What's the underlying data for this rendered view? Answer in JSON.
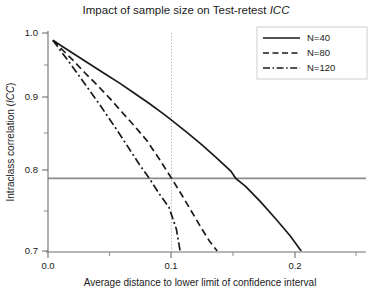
{
  "chart_data": {
    "type": "line",
    "title": "Impact of sample size on Test-retest ICC",
    "title_plain": "Impact of sample size on Test-retest ",
    "title_italic": "ICC",
    "xlabel": "Average distance to lower limit of confidence interval",
    "ylabel_plain": "Intraclass correlation (",
    "ylabel_italic": "ICC",
    "ylabel_tail": ")",
    "ylabel": "Intraclass correlation (ICC)",
    "xlim": [
      0.0,
      0.227
    ],
    "ylim": [
      0.7,
      1.0
    ],
    "xticks": [
      0.0,
      0.1,
      0.2
    ],
    "xticklabels": [
      "0.0",
      "0.1",
      "0.2"
    ],
    "xminorticks": [
      0.05,
      0.15,
      0.2225
    ],
    "yticks": [
      0.7,
      0.8,
      0.9,
      1.0
    ],
    "yticklabels": [
      "0.7",
      "0.8",
      "0.9",
      "1.0"
    ],
    "yminorticks": [
      0.75,
      0.85,
      0.95
    ],
    "grid": false,
    "legend_position": "top-right",
    "reference_lines": [
      {
        "name": "icc-threshold",
        "orient": "horizontal",
        "value": 0.8,
        "style": "solid"
      },
      {
        "name": "distance-threshold",
        "orient": "vertical",
        "value": 0.1,
        "style": "dotted"
      }
    ],
    "series": [
      {
        "name": "N=40",
        "style": "solid",
        "icc_at_0.1": 0.849,
        "distance_at_icc_0.8": 0.152,
        "points": [
          [
            0.004,
            0.99
          ],
          [
            0.012,
            0.981
          ],
          [
            0.022,
            0.97
          ],
          [
            0.034,
            0.957
          ],
          [
            0.046,
            0.944
          ],
          [
            0.058,
            0.931
          ],
          [
            0.07,
            0.917
          ],
          [
            0.082,
            0.903
          ],
          [
            0.094,
            0.888
          ],
          [
            0.1,
            0.88
          ],
          [
            0.112,
            0.864
          ],
          [
            0.124,
            0.847
          ],
          [
            0.136,
            0.829
          ],
          [
            0.148,
            0.81
          ],
          [
            0.152,
            0.8
          ],
          [
            0.16,
            0.789
          ],
          [
            0.172,
            0.768
          ],
          [
            0.184,
            0.745
          ],
          [
            0.196,
            0.721
          ],
          [
            0.205,
            0.7
          ]
        ]
      },
      {
        "name": "N=80",
        "style": "dashed",
        "icc_at_0.1": 0.8,
        "distance_at_icc_0.8": 0.1,
        "points": [
          [
            0.004,
            0.99
          ],
          [
            0.011,
            0.978
          ],
          [
            0.02,
            0.963
          ],
          [
            0.03,
            0.945
          ],
          [
            0.04,
            0.928
          ],
          [
            0.05,
            0.91
          ],
          [
            0.06,
            0.891
          ],
          [
            0.07,
            0.872
          ],
          [
            0.08,
            0.852
          ],
          [
            0.09,
            0.827
          ],
          [
            0.1,
            0.8
          ],
          [
            0.108,
            0.778
          ],
          [
            0.116,
            0.755
          ],
          [
            0.124,
            0.732
          ],
          [
            0.131,
            0.713
          ],
          [
            0.137,
            0.7
          ]
        ]
      },
      {
        "name": "N=120",
        "style": "dashdot",
        "icc_at_0.1": 0.757,
        "distance_at_icc_0.8": 0.082,
        "points": [
          [
            0.004,
            0.99
          ],
          [
            0.01,
            0.976
          ],
          [
            0.018,
            0.958
          ],
          [
            0.026,
            0.939
          ],
          [
            0.034,
            0.92
          ],
          [
            0.042,
            0.901
          ],
          [
            0.05,
            0.881
          ],
          [
            0.058,
            0.861
          ],
          [
            0.066,
            0.84
          ],
          [
            0.074,
            0.819
          ],
          [
            0.082,
            0.8
          ],
          [
            0.09,
            0.779
          ],
          [
            0.098,
            0.76
          ],
          [
            0.104,
            0.73
          ],
          [
            0.107,
            0.7
          ]
        ]
      }
    ],
    "legend": [
      {
        "label": "N=40",
        "style": "solid"
      },
      {
        "label": "N=80",
        "style": "dashed"
      },
      {
        "label": "N=120",
        "style": "dashdot"
      }
    ],
    "colors": {
      "line": "#1a1a1a",
      "axis": "#808080",
      "reference": "#808080",
      "dotted": "#b0b0b0",
      "background": "#ffffff"
    }
  }
}
